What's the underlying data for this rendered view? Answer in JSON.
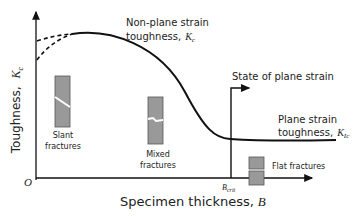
{
  "diagram": {
    "y_axis": {
      "label": "Toughness,",
      "symbol": "K",
      "subscript": "c"
    },
    "x_axis": {
      "label": "Specimen thickness,",
      "symbol": "B"
    },
    "origin": "O",
    "b_crit": {
      "symbol": "B",
      "subscript": "crit"
    },
    "annotations": {
      "non_plane_line1": "Non-plane strain",
      "non_plane_line2": "toughness,",
      "non_plane_symbol": "K",
      "non_plane_sub": "c",
      "plane_state": "State of plane strain",
      "plane_line1": "Plane strain",
      "plane_line2": "toughness,",
      "plane_symbol": "K",
      "plane_sub": "Ic"
    },
    "specimens": [
      {
        "label_line1": "Slant",
        "label_line2": "fractures"
      },
      {
        "label_line1": "Mixed",
        "label_line2": "fractures"
      },
      {
        "label_line1": "Flat fractures"
      }
    ],
    "colors": {
      "line": "#111111",
      "specimen_fill": "#999999",
      "specimen_stroke": "#555555"
    }
  }
}
